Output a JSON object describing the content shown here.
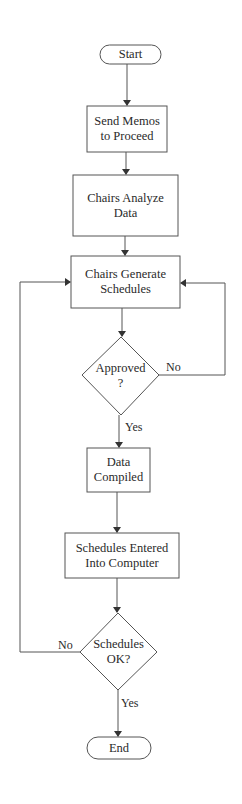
{
  "diagram": {
    "type": "flowchart",
    "nodes": [
      {
        "id": "start",
        "shape": "terminal",
        "lines": [
          "Start"
        ]
      },
      {
        "id": "send-memos",
        "shape": "process",
        "lines": [
          "Send Memos",
          "to Proceed"
        ]
      },
      {
        "id": "chairs-analyze",
        "shape": "process",
        "lines": [
          "Chairs Analyze",
          "Data"
        ]
      },
      {
        "id": "chairs-generate",
        "shape": "process",
        "lines": [
          "Chairs Generate",
          "Schedules"
        ]
      },
      {
        "id": "approved",
        "shape": "decision",
        "lines": [
          "Approved",
          "?"
        ]
      },
      {
        "id": "data-compiled",
        "shape": "process",
        "lines": [
          "Data",
          "Compiled"
        ]
      },
      {
        "id": "schedules-entered",
        "shape": "process",
        "lines": [
          "Schedules Entered",
          "Into Computer"
        ]
      },
      {
        "id": "schedules-ok",
        "shape": "decision",
        "lines": [
          "Schedules",
          "OK?"
        ]
      },
      {
        "id": "end",
        "shape": "terminal",
        "lines": [
          "End"
        ]
      }
    ],
    "edges": [
      {
        "from": "start",
        "to": "send-memos",
        "label": ""
      },
      {
        "from": "send-memos",
        "to": "chairs-analyze",
        "label": ""
      },
      {
        "from": "chairs-analyze",
        "to": "chairs-generate",
        "label": ""
      },
      {
        "from": "chairs-generate",
        "to": "approved",
        "label": ""
      },
      {
        "from": "approved",
        "to": "chairs-generate",
        "label": "No"
      },
      {
        "from": "approved",
        "to": "data-compiled",
        "label": "Yes"
      },
      {
        "from": "data-compiled",
        "to": "schedules-entered",
        "label": ""
      },
      {
        "from": "schedules-entered",
        "to": "schedules-ok",
        "label": ""
      },
      {
        "from": "schedules-ok",
        "to": "chairs-generate",
        "label": "No"
      },
      {
        "from": "schedules-ok",
        "to": "end",
        "label": "Yes"
      }
    ],
    "edge_labels": {
      "approved_no": "No",
      "approved_yes": "Yes",
      "ok_no": "No",
      "ok_yes": "Yes"
    },
    "colors": {
      "stroke": "#555555",
      "text": "#2a2a2a",
      "background": "#ffffff"
    }
  }
}
